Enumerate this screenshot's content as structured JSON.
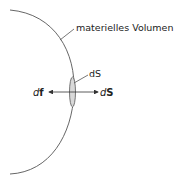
{
  "diagram": {
    "volume_label": "materielles Volumen",
    "surface_element_label": "dS",
    "force_label": {
      "d": "d",
      "f": "f"
    },
    "normal_label": {
      "d": "d",
      "S": "S"
    },
    "colors": {
      "line": "#444444",
      "ellipse_fill": "#d9d9d9",
      "text": "#222222"
    }
  }
}
